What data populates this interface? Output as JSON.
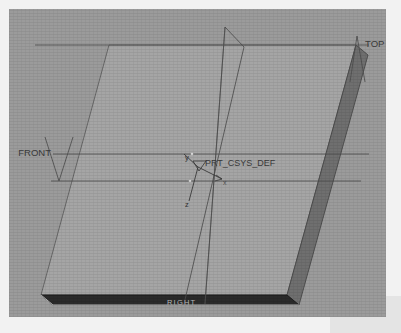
{
  "app": {
    "viewport_label": "cad-3d-viewport",
    "background_color": "#9b9b9b",
    "page_color": "#f2f2f2"
  },
  "model": {
    "type": "rectangular-plate",
    "top_face_color": "#a5a5a5",
    "front_edge_color": "#2b2b2b",
    "side_edge_color": "#6f6f6f",
    "edge_line_color": "#5a5a5a"
  },
  "datum_planes": [
    {
      "id": "top",
      "label": "TOP",
      "orientation": "horizontal"
    },
    {
      "id": "front",
      "label": "FRONT",
      "orientation": "horizontal"
    },
    {
      "id": "right",
      "label": "RIGHT",
      "orientation": "vertical"
    }
  ],
  "coordinate_system": {
    "name": "PRT_CSYS_DEF",
    "axes": [
      {
        "label": "x"
      },
      {
        "label": "y"
      },
      {
        "label": "z"
      }
    ]
  }
}
